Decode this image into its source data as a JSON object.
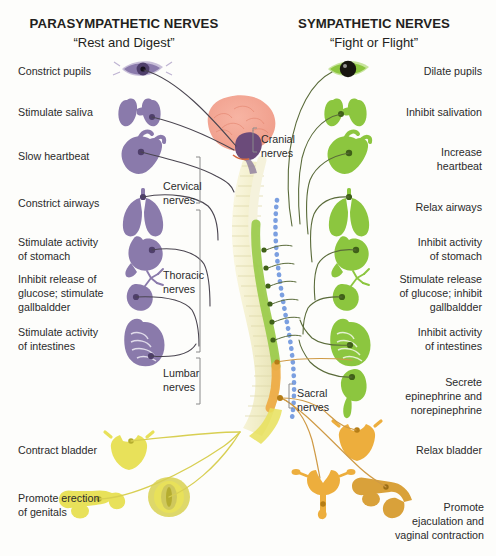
{
  "diagram": {
    "columns": {
      "parasympathetic": {
        "heading": "PARASYMPATHETIC NERVES",
        "subheading": "“Rest and Digest”",
        "color": "#8a7aab"
      },
      "sympathetic": {
        "heading": "SYMPATHETIC NERVES",
        "subheading": "“Fight or Flight”",
        "color": "#8cc63f"
      }
    },
    "parasympathetic_labels": [
      {
        "id": "pupils",
        "text": "Constrict pupils",
        "x": 18,
        "y": 70,
        "organ": "eye-icon"
      },
      {
        "id": "saliva",
        "text": "Stimulate saliva",
        "x": 18,
        "y": 110,
        "organ": "salivary-gland-icon"
      },
      {
        "id": "heart",
        "text": "Slow heartbeat",
        "x": 18,
        "y": 152,
        "organ": "heart-icon"
      },
      {
        "id": "airways",
        "text": "Constrict airways",
        "x": 18,
        "y": 200,
        "organ": "lungs-icon"
      },
      {
        "id": "stomach",
        "text": "Stimulate activity\nof stomach",
        "x": 18,
        "y": 240,
        "organ": "stomach-icon"
      },
      {
        "id": "liver",
        "text": "Inhibit release of\nglucose; stimulate\ngallbaldder",
        "x": 18,
        "y": 275,
        "organ": "liver-gallbladder-icon"
      },
      {
        "id": "intestines",
        "text": "Stimulate activity\nof intestines",
        "x": 18,
        "y": 329,
        "organ": "intestines-icon"
      },
      {
        "id": "bladder",
        "text": "Contract bladder",
        "x": 18,
        "y": 447,
        "organ": "bladder-icon"
      },
      {
        "id": "genitals",
        "text": "Promote erection\nof genitals",
        "x": 18,
        "y": 496,
        "organ": "male-genitals-icon"
      }
    ],
    "sympathetic_labels": [
      {
        "id": "pupils",
        "text": "Dilate pupils",
        "x": 398,
        "y": 70,
        "organ": "eye-icon"
      },
      {
        "id": "saliva",
        "text": "Inhibit salivation",
        "x": 386,
        "y": 110,
        "organ": "salivary-gland-icon"
      },
      {
        "id": "heart",
        "text": "Increase\nheartbeat",
        "x": 406,
        "y": 148,
        "organ": "heart-icon"
      },
      {
        "id": "airways",
        "text": "Relax airways",
        "x": 398,
        "y": 203,
        "organ": "lungs-icon"
      },
      {
        "id": "stomach",
        "text": "Inhibit activity\nof stomach",
        "x": 390,
        "y": 240,
        "organ": "stomach-icon"
      },
      {
        "id": "liver",
        "text": "Stimulate release\nof glucose; inhibit\ngallbaldder",
        "x": 371,
        "y": 275,
        "organ": "liver-gallbladder-icon"
      },
      {
        "id": "intestines",
        "text": "Inhibit activity\nof intestines",
        "x": 390,
        "y": 329,
        "organ": "intestines-icon"
      },
      {
        "id": "adrenal",
        "text": "Secrete\nepinephrine and\nnorepinephrine",
        "x": 374,
        "y": 378,
        "organ": "adrenal-kidney-icon"
      },
      {
        "id": "bladder",
        "text": "Relax bladder",
        "x": 396,
        "y": 447,
        "organ": "bladder-icon"
      },
      {
        "id": "genitals",
        "text": "Promote\nejaculation and\nvaginal contraction",
        "x": 363,
        "y": 503,
        "organ": "genitals-icon"
      }
    ],
    "spine_labels": [
      {
        "id": "cranial",
        "text": "Cranial\nnerves",
        "x": 261,
        "y": 136,
        "bracket_color": "#7a7a7a"
      },
      {
        "id": "cervical",
        "text": "Cervical\nnerves",
        "x": 171,
        "y": 183,
        "bracket_color": "#7a7a7a"
      },
      {
        "id": "thoracic",
        "text": "Thoracic\nnerves",
        "x": 171,
        "y": 272,
        "bracket_color": "#7a7a7a"
      },
      {
        "id": "lumbar",
        "text": "Lumbar\nnerves",
        "x": 168,
        "y": 370,
        "bracket_color": "#7a7a7a"
      },
      {
        "id": "sacral",
        "text": "Sacral\nnerves",
        "x": 295,
        "y": 392,
        "bracket_color": "#7a7a7a"
      }
    ],
    "anatomy": {
      "brain": "brain-icon",
      "brainstem": "brainstem-icon",
      "vertebral_column": "vertebral-column-icon",
      "spinal_cord": "spinal-cord-icon",
      "dotted_tract": "blue-dotted-tract-icon"
    },
    "colors": {
      "parasympathetic_organ": "#8a7aab",
      "parasympathetic_nerve": "#4a4550",
      "sympathetic_organ": "#8cc63f",
      "sympathetic_nerve": "#5a6b3a",
      "sacral_yellow": "#e8e15a",
      "sacral_orange": "#edae3d",
      "brain_pink": "#f4a896",
      "brainstem_purple": "#6b4b7a",
      "spine_cream": "#f2efd0",
      "cord_green": "#9acb4a",
      "cord_orange": "#eeab44",
      "tract_blue": "#7b9fe0",
      "text": "#2b2b2b"
    }
  }
}
